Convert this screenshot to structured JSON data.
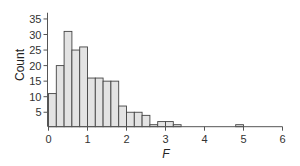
{
  "chart_data": {
    "type": "bar",
    "subtype": "histogram",
    "title": "",
    "xlabel": "F",
    "ylabel": "Count",
    "bin_width": 0.2,
    "bin_start": 0,
    "bins": [
      {
        "x0": 0.0,
        "x1": 0.2,
        "count": 11
      },
      {
        "x0": 0.2,
        "x1": 0.4,
        "count": 20
      },
      {
        "x0": 0.4,
        "x1": 0.6,
        "count": 31
      },
      {
        "x0": 0.6,
        "x1": 0.8,
        "count": 25
      },
      {
        "x0": 0.8,
        "x1": 1.0,
        "count": 26
      },
      {
        "x0": 1.0,
        "x1": 1.2,
        "count": 16
      },
      {
        "x0": 1.2,
        "x1": 1.4,
        "count": 16
      },
      {
        "x0": 1.4,
        "x1": 1.6,
        "count": 15
      },
      {
        "x0": 1.6,
        "x1": 1.8,
        "count": 15
      },
      {
        "x0": 1.8,
        "x1": 2.0,
        "count": 7
      },
      {
        "x0": 2.0,
        "x1": 2.2,
        "count": 5
      },
      {
        "x0": 2.2,
        "x1": 2.4,
        "count": 5
      },
      {
        "x0": 2.4,
        "x1": 2.6,
        "count": 4
      },
      {
        "x0": 2.6,
        "x1": 2.8,
        "count": 1
      },
      {
        "x0": 2.8,
        "x1": 3.0,
        "count": 2
      },
      {
        "x0": 3.0,
        "x1": 3.2,
        "count": 2
      },
      {
        "x0": 3.2,
        "x1": 3.4,
        "count": 1
      },
      {
        "x0": 4.8,
        "x1": 5.0,
        "count": 1
      }
    ],
    "xlim": [
      0,
      6
    ],
    "ylim": [
      0,
      37
    ],
    "xticks": [
      0,
      1,
      2,
      3,
      4,
      5,
      6
    ],
    "yticks": [
      5,
      10,
      15,
      20,
      25,
      30,
      35
    ],
    "grid": false,
    "legend": null,
    "colors": {
      "bar_fill": "#e3e3e3",
      "bar_stroke": "#444444",
      "axis": "#555555",
      "text": "#333333"
    }
  }
}
